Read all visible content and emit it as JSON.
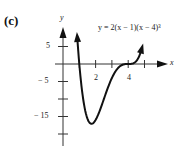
{
  "panel_label": "(c)",
  "chart_data": {
    "type": "line",
    "title": "",
    "annotation": "y = 2(x − 1)(x − 4)³",
    "function": "y = 2(x-1)(x-4)^3",
    "xlabel": "x",
    "ylabel": "y",
    "x_ticks": [
      1,
      2,
      3,
      4,
      5
    ],
    "x_tick_labels": [
      "2",
      "4"
    ],
    "x_tick_label_values": [
      2,
      4
    ],
    "y_ticks": [
      5,
      0,
      -5,
      -10,
      -15,
      -20
    ],
    "y_tick_labels": [
      "5",
      "− 5",
      "− 15"
    ],
    "y_tick_label_values": [
      5,
      -5,
      -15
    ],
    "xlim": [
      0,
      5.8
    ],
    "ylim": [
      -22,
      10
    ],
    "grid": false,
    "legend": null,
    "series": [
      {
        "name": "y = 2(x-1)(x-4)^3",
        "x": [
          0.87,
          1.0,
          1.25,
          1.5,
          1.75,
          2.0,
          2.5,
          3.0,
          3.5,
          4.0,
          4.5,
          4.85
        ],
        "values": [
          6.75,
          0,
          -11.4,
          -15.6,
          -16.6,
          -16.0,
          -10.1,
          -4.0,
          -0.63,
          0,
          0.44,
          4.53
        ]
      }
    ],
    "key_points": {
      "minimum": {
        "x": 1.75,
        "y": -16.6
      },
      "roots": [
        1,
        4
      ]
    },
    "arrows_on_curve_ends": true
  },
  "text": {
    "x_axis_label": "x",
    "y_axis_label": "y",
    "equation": "y = 2(x − 1)(x − 4)³",
    "xtick_2": "2",
    "xtick_4": "4",
    "ytick_5": "5",
    "ytick_m5": "− 5",
    "ytick_m15": "− 15"
  }
}
